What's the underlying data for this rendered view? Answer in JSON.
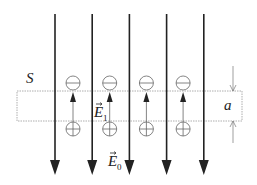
{
  "diagram": {
    "title": "",
    "labels": {
      "surface": "S",
      "thickness": "a",
      "inner_field": {
        "symbol": "E",
        "subscript": "1"
      },
      "outer_field": {
        "symbol": "E",
        "subscript": "0"
      }
    },
    "external_field_lines": {
      "count": 5,
      "direction": "down",
      "color": "#222222"
    },
    "dipoles": {
      "count": 4,
      "top_charge": "negative",
      "bottom_charge": "positive",
      "internal_field_direction": "up",
      "color": "#666666"
    },
    "slab": {
      "border_style": "dotted",
      "color": "#888888"
    }
  }
}
